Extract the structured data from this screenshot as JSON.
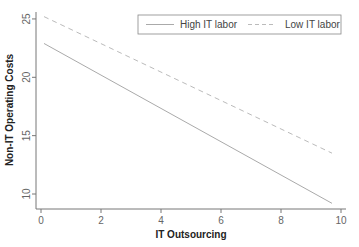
{
  "chart_data": {
    "type": "line",
    "title": "",
    "xlabel": "IT Outsourcing",
    "ylabel": "Non-IT Operating Costs",
    "xlim": [
      0,
      10
    ],
    "ylim": [
      10,
      25
    ],
    "xticks": [
      "0",
      "2",
      "4",
      "6",
      "8",
      "10"
    ],
    "yticks": [
      "10",
      "15",
      "20",
      "25"
    ],
    "grid": false,
    "legend_position": "top-right",
    "series": [
      {
        "name": "High IT labor",
        "style": "solid",
        "color": "#aaaaaa",
        "x": [
          0.1,
          9.7
        ],
        "y": [
          22.9,
          9.2
        ]
      },
      {
        "name": "Low IT labor",
        "style": "dashed",
        "color": "#bbbbbb",
        "x": [
          0.1,
          9.7
        ],
        "y": [
          25.2,
          13.5
        ]
      }
    ]
  },
  "legend": {
    "items": [
      "High IT labor",
      "Low IT labor"
    ]
  }
}
